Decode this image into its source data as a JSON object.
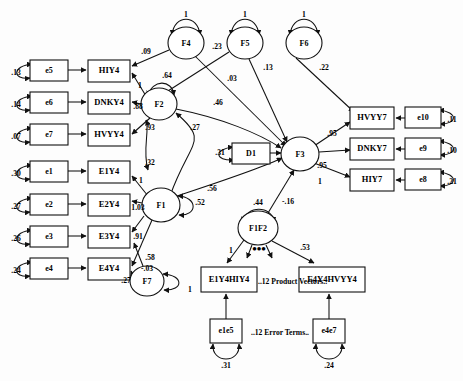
{
  "diagram": {
    "annotations": [
      {
        "id": "product-vectors-note",
        "text": "..12 Product Vectors..",
        "x": 268,
        "y": 307
      },
      {
        "id": "error-terms-note",
        "text": "..12 Error Terms..",
        "x": 262,
        "y": 347
      }
    ],
    "boxes": [
      {
        "id": "e5",
        "label": "e5",
        "x": 30,
        "y": 60,
        "w": 38,
        "h": 21
      },
      {
        "id": "e6",
        "label": "e6",
        "x": 30,
        "y": 92,
        "w": 38,
        "h": 21
      },
      {
        "id": "e7",
        "label": "e7",
        "x": 30,
        "y": 124,
        "w": 38,
        "h": 21
      },
      {
        "id": "e1",
        "label": "e1",
        "x": 30,
        "y": 161,
        "w": 38,
        "h": 21
      },
      {
        "id": "e2",
        "label": "e2",
        "x": 30,
        "y": 194,
        "w": 38,
        "h": 21
      },
      {
        "id": "e3",
        "label": "e3",
        "x": 30,
        "y": 226,
        "w": 38,
        "h": 21
      },
      {
        "id": "e4",
        "label": "e4",
        "x": 30,
        "y": 258,
        "w": 38,
        "h": 21
      },
      {
        "id": "HIY4",
        "label": "HIY4",
        "x": 88,
        "y": 60,
        "w": 42,
        "h": 22
      },
      {
        "id": "DNKY4",
        "label": "DNKY4",
        "x": 88,
        "y": 92,
        "w": 42,
        "h": 22
      },
      {
        "id": "HVYY4",
        "label": "HVYY4",
        "x": 88,
        "y": 124,
        "w": 42,
        "h": 22
      },
      {
        "id": "E1Y4",
        "label": "E1Y4",
        "x": 88,
        "y": 161,
        "w": 42,
        "h": 22
      },
      {
        "id": "E2Y4",
        "label": "E2Y4",
        "x": 88,
        "y": 194,
        "w": 42,
        "h": 22
      },
      {
        "id": "E3Y4",
        "label": "E3Y4",
        "x": 88,
        "y": 226,
        "w": 42,
        "h": 22
      },
      {
        "id": "E4Y4",
        "label": "E4Y4",
        "x": 88,
        "y": 258,
        "w": 42,
        "h": 22
      },
      {
        "id": "D1",
        "label": "D1",
        "x": 232,
        "y": 143,
        "w": 38,
        "h": 21
      },
      {
        "id": "HVYY7",
        "label": "HVYY7",
        "x": 350,
        "y": 107,
        "w": 44,
        "h": 22
      },
      {
        "id": "DNKY7",
        "label": "DNKY7",
        "x": 350,
        "y": 138,
        "w": 44,
        "h": 22
      },
      {
        "id": "HIY7",
        "label": "HIY7",
        "x": 350,
        "y": 169,
        "w": 44,
        "h": 22
      },
      {
        "id": "e10",
        "label": "e10",
        "x": 405,
        "y": 107,
        "w": 36,
        "h": 21
      },
      {
        "id": "e9",
        "label": "e9",
        "x": 405,
        "y": 138,
        "w": 36,
        "h": 21
      },
      {
        "id": "e8",
        "label": "e8",
        "x": 405,
        "y": 169,
        "w": 36,
        "h": 21
      },
      {
        "id": "E1Y4HIY4",
        "label": "E1Y4HIY4",
        "x": 201,
        "y": 267,
        "w": 56,
        "h": 25
      },
      {
        "id": "E4Y4HVYY4",
        "label": "E4Y4HVYY4",
        "x": 299,
        "y": 267,
        "w": 66,
        "h": 25
      },
      {
        "id": "e1e5",
        "label": "e1e5",
        "x": 210,
        "y": 319,
        "w": 32,
        "h": 24
      },
      {
        "id": "e4e7",
        "label": "e4e7",
        "x": 313,
        "y": 319,
        "w": 32,
        "h": 24
      }
    ],
    "ellipses": [
      {
        "id": "F4",
        "label": "F4",
        "cx": 186,
        "cy": 43,
        "rx": 18,
        "ry": 16
      },
      {
        "id": "F5",
        "label": "F5",
        "cx": 245,
        "cy": 43,
        "rx": 18,
        "ry": 16
      },
      {
        "id": "F6",
        "label": "F6",
        "cx": 304,
        "cy": 43,
        "rx": 18,
        "ry": 16
      },
      {
        "id": "F2",
        "label": "F2",
        "cx": 159,
        "cy": 104,
        "rx": 18,
        "ry": 16
      },
      {
        "id": "F1",
        "label": "F1",
        "cx": 161,
        "cy": 205,
        "rx": 19,
        "ry": 17
      },
      {
        "id": "F7",
        "label": "F7",
        "cx": 147,
        "cy": 281,
        "rx": 17,
        "ry": 15
      },
      {
        "id": "F3",
        "label": "F3",
        "cx": 300,
        "cy": 154,
        "rx": 19,
        "ry": 17
      },
      {
        "id": "F1F2",
        "label": "F1F2",
        "cx": 258,
        "cy": 228,
        "rx": 20,
        "ry": 17
      }
    ],
    "coefficients": [
      {
        "id": "coef-e5",
        "value": ".13",
        "x": 16,
        "y": 73
      },
      {
        "id": "coef-e6",
        "value": ".14",
        "x": 16,
        "y": 105
      },
      {
        "id": "coef-e7",
        "value": ".07",
        "x": 16,
        "y": 137
      },
      {
        "id": "coef-e1",
        "value": ".30",
        "x": 16,
        "y": 174
      },
      {
        "id": "coef-e2",
        "value": ".27",
        "x": 16,
        "y": 207
      },
      {
        "id": "coef-e3",
        "value": ".26",
        "x": 16,
        "y": 239
      },
      {
        "id": "coef-e4",
        "value": ".24",
        "x": 16,
        "y": 271
      },
      {
        "id": "coef-F4-loop",
        "value": "1",
        "x": 186,
        "y": 15
      },
      {
        "id": "coef-F5-loop",
        "value": "1",
        "x": 245,
        "y": 15
      },
      {
        "id": "coef-F6-loop",
        "value": "1",
        "x": 304,
        "y": 15
      },
      {
        "id": "coef-F4-HIY4",
        "value": ".09",
        "x": 146,
        "y": 52
      },
      {
        "id": "coef-F4-F5",
        "value": ".23",
        "x": 217,
        "y": 47
      },
      {
        "id": "coef-F5-F3",
        "value": ".03",
        "x": 232,
        "y": 79
      },
      {
        "id": "coef-F5-x",
        "value": ".13",
        "x": 268,
        "y": 68
      },
      {
        "id": "coef-F6-HVYY7",
        "value": ".22",
        "x": 324,
        "y": 68
      },
      {
        "id": "coef-F2-loop",
        "value": ".64",
        "x": 167,
        "y": 76
      },
      {
        "id": "coef-F2-HIY4",
        "value": "1",
        "x": 140,
        "y": 86
      },
      {
        "id": "coef-F2-DNKY4",
        "value": ".88",
        "x": 138,
        "y": 107
      },
      {
        "id": "coef-F2-HVYY4",
        "value": ".93",
        "x": 150,
        "y": 128
      },
      {
        "id": "coef-F2-F3",
        "value": ".46",
        "x": 218,
        "y": 103
      },
      {
        "id": "coef-F2-F1",
        "value": ".27",
        "x": 195,
        "y": 128
      },
      {
        "id": "coef-F1-F2-cov",
        "value": ".32",
        "x": 150,
        "y": 163
      },
      {
        "id": "coef-F1-E1Y4",
        "value": "1",
        "x": 141,
        "y": 181
      },
      {
        "id": "coef-F1-E2Y4",
        "value": "1.03",
        "x": 138,
        "y": 208
      },
      {
        "id": "coef-F1-E3Y4",
        "value": ".91",
        "x": 138,
        "y": 237
      },
      {
        "id": "coef-F1-E4Y4",
        "value": ".58",
        "x": 150,
        "y": 258
      },
      {
        "id": "coef-F1-loop",
        "value": ".52",
        "x": 200,
        "y": 203
      },
      {
        "id": "coef-F1-F3",
        "value": ".56",
        "x": 212,
        "y": 189
      },
      {
        "id": "coef-F7-E3Y4",
        "value": "-.03",
        "x": 147,
        "y": 269
      },
      {
        "id": "coef-F7-E4Y4",
        "value": ".27",
        "x": 126,
        "y": 281
      },
      {
        "id": "coef-F7-loop",
        "value": "1",
        "x": 190,
        "y": 290
      },
      {
        "id": "coef-D1",
        "value": ".31",
        "x": 220,
        "y": 153
      },
      {
        "id": "coef-F3-HVYY7",
        "value": ".95",
        "x": 332,
        "y": 134
      },
      {
        "id": "coef-F3-DNKY7",
        "value": ".95",
        "x": 322,
        "y": 166
      },
      {
        "id": "coef-F3-HIY7",
        "value": "1",
        "x": 320,
        "y": 182
      },
      {
        "id": "coef-e10",
        "value": ".11",
        "x": 452,
        "y": 120
      },
      {
        "id": "coef-e9",
        "value": ".10",
        "x": 452,
        "y": 151
      },
      {
        "id": "coef-e8",
        "value": ".21",
        "x": 452,
        "y": 182
      },
      {
        "id": "coef-F1F2-F3",
        "value": "-.16",
        "x": 288,
        "y": 202
      },
      {
        "id": "coef-F1F2-loop",
        "value": ".44",
        "x": 258,
        "y": 203
      },
      {
        "id": "coef-F1F2-p1",
        "value": "1",
        "x": 231,
        "y": 251
      },
      {
        "id": "coef-F1F2-p12",
        "value": ".53",
        "x": 305,
        "y": 248
      },
      {
        "id": "coef-e1e5",
        "value": ".31",
        "x": 226,
        "y": 366
      },
      {
        "id": "coef-e4e7",
        "value": ".24",
        "x": 329,
        "y": 366
      }
    ]
  }
}
